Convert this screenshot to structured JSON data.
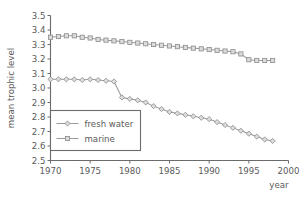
{
  "chart_data": {
    "type": "line",
    "title": "",
    "xlabel": "year",
    "ylabel": "mean trophic level",
    "xlim": [
      1970,
      2000
    ],
    "ylim": [
      2.5,
      3.5
    ],
    "xticks": [
      1970,
      1975,
      1980,
      1985,
      1990,
      1995,
      2000
    ],
    "xtick_labels": [
      "1970",
      "1975",
      "1980",
      "1985",
      "1990",
      "1995",
      "2000"
    ],
    "yticks": [
      2.5,
      2.6,
      2.7,
      2.8,
      2.9,
      3.0,
      3.1,
      3.2,
      3.3,
      3.4,
      3.5
    ],
    "ytick_labels": [
      "2.5",
      "2.6",
      "2.7",
      "2.8",
      "2.9",
      "3.0",
      "3.1",
      "3.2",
      "3.3",
      "3.4",
      "3.5"
    ],
    "grid": false,
    "legend_position": "lower left",
    "x": [
      1970,
      1971,
      1972,
      1973,
      1974,
      1975,
      1976,
      1977,
      1978,
      1979,
      1980,
      1981,
      1982,
      1983,
      1984,
      1985,
      1986,
      1987,
      1988,
      1989,
      1990,
      1991,
      1992,
      1993,
      1994,
      1995,
      1996,
      1997,
      1998
    ],
    "series": [
      {
        "name": "fresh water",
        "marker": "diamond",
        "color": "#9a9a9a",
        "values": [
          3.06,
          3.06,
          3.06,
          3.06,
          3.055,
          3.06,
          3.055,
          3.05,
          3.045,
          2.935,
          2.925,
          2.915,
          2.9,
          2.875,
          2.855,
          2.835,
          2.825,
          2.815,
          2.805,
          2.795,
          2.785,
          2.765,
          2.745,
          2.725,
          2.705,
          2.685,
          2.665,
          2.645,
          2.635
        ]
      },
      {
        "name": "marine",
        "marker": "square",
        "color": "#9a9a9a",
        "values": [
          3.35,
          3.355,
          3.36,
          3.36,
          3.35,
          3.345,
          3.335,
          3.33,
          3.325,
          3.32,
          3.315,
          3.31,
          3.305,
          3.3,
          3.295,
          3.29,
          3.285,
          3.28,
          3.275,
          3.27,
          3.265,
          3.26,
          3.255,
          3.25,
          3.235,
          3.195,
          3.19,
          3.19,
          3.19
        ]
      }
    ]
  }
}
